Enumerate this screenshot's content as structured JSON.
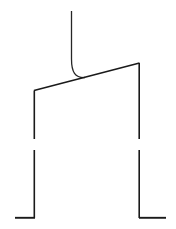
{
  "canvas": {
    "width": 176,
    "height": 229,
    "background_color": "#ffffff",
    "stroke_color": "#1a1a1a",
    "title": "Line Drawing"
  },
  "figure": {
    "strokes": [
      {
        "name": "vertical-stem",
        "kind": "line",
        "path": "M 71.5 11 L 71.5 59"
      },
      {
        "name": "hook-curve",
        "kind": "curve",
        "path": "M 71.5 59 C 71.5 72 75 78 85 77.5"
      },
      {
        "name": "diagonal-crossbar",
        "kind": "line",
        "path": "M 34 90.5 L 139.5 63"
      },
      {
        "name": "left-rail-upper",
        "kind": "line",
        "path": "M 34.3 90.5 L 34.3 139"
      },
      {
        "name": "right-rail-upper",
        "kind": "line",
        "path": "M 139.2 63 L 139.2 139"
      },
      {
        "name": "left-leg",
        "kind": "line",
        "path": "M 34.3 150 L 34.3 218"
      },
      {
        "name": "right-leg",
        "kind": "line",
        "path": "M 139.2 150 L 139.2 218"
      },
      {
        "name": "left-foot",
        "kind": "line",
        "path": "M 15 217.8 L 35 217.8"
      },
      {
        "name": "right-foot",
        "kind": "line",
        "path": "M 139 217.8 L 166 217.8"
      }
    ]
  }
}
